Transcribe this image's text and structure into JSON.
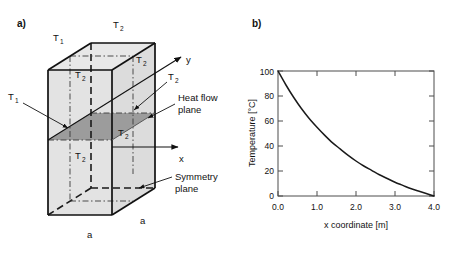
{
  "figure": {
    "panel_a_label": "a)",
    "panel_b_label": "b)"
  },
  "diagram": {
    "labels": {
      "t1": "T",
      "t1_sub": "1",
      "t2": "T",
      "t2_sub": "2",
      "axis_x": "x",
      "axis_y": "y",
      "dimension_a": "a",
      "heat_flow_line1": "Heat flow",
      "heat_flow_line2": "plane",
      "symmetry_line1": "Symmetry",
      "symmetry_line2": "plane"
    },
    "colors": {
      "face_light": "#e2e2e2",
      "face_mid": "#d6d6d6",
      "heat_plane": "#9a9a9a",
      "edge": "#1a1a1a"
    },
    "t2_occurrences": 7,
    "t1_occurrences": 2,
    "a_occurrences": 2
  },
  "chart_data": {
    "type": "line",
    "title": "",
    "xlabel": "x coordinate [m]",
    "ylabel": "Temperature [°C]",
    "xlim": [
      0.0,
      4.0
    ],
    "ylim": [
      0,
      100
    ],
    "xticks": [
      "0.0",
      "1.0",
      "2.0",
      "3.0",
      "4.0"
    ],
    "xtick_values": [
      0.0,
      1.0,
      2.0,
      3.0,
      4.0
    ],
    "yticks": [
      "0",
      "20",
      "40",
      "60",
      "80",
      "100"
    ],
    "ytick_values": [
      0,
      20,
      40,
      60,
      80,
      100
    ],
    "grid": false,
    "legend": null,
    "series": [
      {
        "name": "Temperature profile",
        "x": [
          0.0,
          0.2,
          0.4,
          0.6,
          0.8,
          1.0,
          1.2,
          1.4,
          1.6,
          1.8,
          2.0,
          2.2,
          2.4,
          2.6,
          2.8,
          3.0,
          3.2,
          3.4,
          3.6,
          3.8,
          4.0
        ],
        "y": [
          100.0,
          89.0,
          79.0,
          70.0,
          62.0,
          55.0,
          48.5,
          42.5,
          37.5,
          32.5,
          28.0,
          24.0,
          20.5,
          17.0,
          14.0,
          11.0,
          8.5,
          6.0,
          4.0,
          2.0,
          0.0
        ]
      }
    ],
    "line_color": "#1a1a1a",
    "axis_color": "#4d4d4d"
  },
  "artifact": {
    "top_text": ""
  }
}
